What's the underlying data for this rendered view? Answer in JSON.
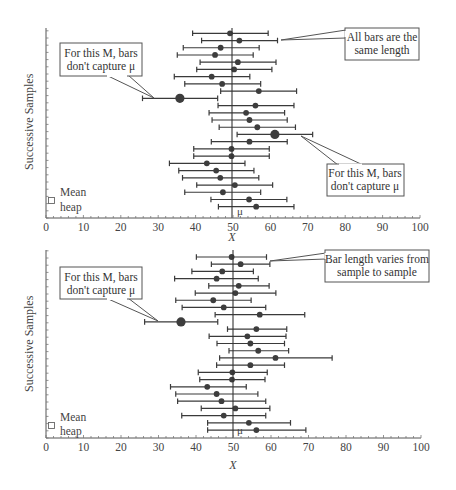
{
  "chart_data": [
    {
      "type": "errorbar",
      "title": "",
      "panel": "top",
      "xlabel": "X",
      "ylabel": "Successive Samples",
      "xlim": [
        0,
        100
      ],
      "xticks": [
        0,
        10,
        20,
        30,
        40,
        50,
        60,
        70,
        80,
        90,
        100
      ],
      "mu": 50,
      "mu_label": "μ",
      "legend": {
        "symbol": "Mean heap",
        "line1": "Mean",
        "line2": "heap"
      },
      "grid": false,
      "callouts": [
        {
          "line1": "For this M, bars",
          "line1_italic_word": "M",
          "line2": "don't capture μ"
        },
        {
          "line1": "All bars are the",
          "line2": "same length"
        },
        {
          "line1": "For this M, bars",
          "line2": "don't capture μ"
        }
      ],
      "samples": [
        {
          "mean": 49.2,
          "lo": 39.2,
          "hi": 59.4
        },
        {
          "mean": 51.7,
          "lo": 41.6,
          "hi": 61.9
        },
        {
          "mean": 46.7,
          "lo": 36.7,
          "hi": 57.0
        },
        {
          "mean": 45.2,
          "lo": 35.1,
          "hi": 55.4
        },
        {
          "mean": 51.3,
          "lo": 41.2,
          "hi": 61.5
        },
        {
          "mean": 50.3,
          "lo": 40.3,
          "hi": 60.4
        },
        {
          "mean": 44.3,
          "lo": 34.3,
          "hi": 54.5
        },
        {
          "mean": 47.1,
          "lo": 37.1,
          "hi": 57.4
        },
        {
          "mean": 56.9,
          "lo": 46.7,
          "hi": 67.0
        },
        {
          "mean": 35.8,
          "lo": 25.8,
          "hi": 45.9,
          "misses_mu": true
        },
        {
          "mean": 56.0,
          "lo": 46.0,
          "hi": 66.3
        },
        {
          "mean": 53.5,
          "lo": 43.6,
          "hi": 63.8
        },
        {
          "mean": 54.4,
          "lo": 44.4,
          "hi": 64.5
        },
        {
          "mean": 56.5,
          "lo": 46.3,
          "hi": 66.7
        },
        {
          "mean": 61.2,
          "lo": 51.1,
          "hi": 71.3,
          "misses_mu": true
        },
        {
          "mean": 54.4,
          "lo": 44.2,
          "hi": 64.5
        },
        {
          "mean": 49.6,
          "lo": 39.5,
          "hi": 59.7
        },
        {
          "mean": 49.6,
          "lo": 39.5,
          "hi": 59.7
        },
        {
          "mean": 43.0,
          "lo": 33.0,
          "hi": 53.2
        },
        {
          "mean": 45.5,
          "lo": 35.5,
          "hi": 55.6
        },
        {
          "mean": 46.6,
          "lo": 36.5,
          "hi": 56.9
        },
        {
          "mean": 50.5,
          "lo": 40.3,
          "hi": 60.6
        },
        {
          "mean": 47.3,
          "lo": 37.1,
          "hi": 57.4
        },
        {
          "mean": 54.3,
          "lo": 44.1,
          "hi": 64.4
        },
        {
          "mean": 56.2,
          "lo": 46.1,
          "hi": 66.3
        }
      ]
    },
    {
      "type": "errorbar",
      "title": "",
      "panel": "bottom",
      "xlabel": "X",
      "ylabel": "Successive Samples",
      "xlim": [
        0,
        100
      ],
      "xticks": [
        0,
        10,
        20,
        30,
        40,
        50,
        60,
        70,
        80,
        90,
        100
      ],
      "mu": 50,
      "mu_label": "μ",
      "legend": {
        "symbol": "Mean heap",
        "line1": "Mean",
        "line2": "heap"
      },
      "grid": false,
      "callouts": [
        {
          "line1": "For this M, bars",
          "line2": "don't capture μ"
        },
        {
          "line1": "Bar length varies from",
          "line2": "sample to sample"
        }
      ],
      "samples": [
        {
          "mean": 49.5,
          "lo": 40.1,
          "hi": 58.8
        },
        {
          "mean": 51.9,
          "lo": 44.1,
          "hi": 59.7
        },
        {
          "mean": 47.0,
          "lo": 38.9,
          "hi": 55.3
        },
        {
          "mean": 45.5,
          "lo": 34.3,
          "hi": 56.6
        },
        {
          "mean": 51.4,
          "lo": 43.4,
          "hi": 59.5
        },
        {
          "mean": 50.5,
          "lo": 39.8,
          "hi": 61.3
        },
        {
          "mean": 44.6,
          "lo": 34.6,
          "hi": 54.7
        },
        {
          "mean": 47.4,
          "lo": 36.3,
          "hi": 58.6
        },
        {
          "mean": 57.0,
          "lo": 45.1,
          "hi": 69.0
        },
        {
          "mean": 36.0,
          "lo": 26.3,
          "hi": 45.8,
          "misses_mu": true
        },
        {
          "mean": 56.1,
          "lo": 48.4,
          "hi": 64.2
        },
        {
          "mean": 53.7,
          "lo": 43.5,
          "hi": 64.0
        },
        {
          "mean": 54.5,
          "lo": 45.6,
          "hi": 63.6
        },
        {
          "mean": 56.6,
          "lo": 48.8,
          "hi": 64.7
        },
        {
          "mean": 61.2,
          "lo": 46.3,
          "hi": 76.3
        },
        {
          "mean": 54.5,
          "lo": 45.5,
          "hi": 63.6
        },
        {
          "mean": 49.7,
          "lo": 40.6,
          "hi": 59.0
        },
        {
          "mean": 49.6,
          "lo": 41.0,
          "hi": 58.4
        },
        {
          "mean": 43.0,
          "lo": 33.2,
          "hi": 53.4
        },
        {
          "mean": 45.5,
          "lo": 34.6,
          "hi": 56.5
        },
        {
          "mean": 46.8,
          "lo": 35.1,
          "hi": 58.6
        },
        {
          "mean": 50.5,
          "lo": 41.4,
          "hi": 59.7
        },
        {
          "mean": 47.4,
          "lo": 36.2,
          "hi": 58.6
        },
        {
          "mean": 54.1,
          "lo": 43.1,
          "hi": 65.2
        },
        {
          "mean": 56.1,
          "lo": 43.1,
          "hi": 69.3
        }
      ]
    }
  ],
  "panels": {
    "top": {
      "ylabel": "Successive Samples",
      "xlabel": "X",
      "legend_line1": "Mean",
      "legend_line2": "heap",
      "mu_label": "μ",
      "callout_left_1": "For this M, bars",
      "callout_left_2": "don't capture μ",
      "callout_right_top_1": "All bars are the",
      "callout_right_top_2": "same length",
      "callout_right_bottom_1": "For this M, bars",
      "callout_right_bottom_2": "don't capture μ"
    },
    "bottom": {
      "ylabel": "Successive Samples",
      "xlabel": "X",
      "legend_line1": "Mean",
      "legend_line2": "heap",
      "mu_label": "μ",
      "callout_left_1": "For this M, bars",
      "callout_left_2": "don't capture μ",
      "callout_right_1": "Bar length varies from",
      "callout_right_2": "sample to sample"
    }
  }
}
